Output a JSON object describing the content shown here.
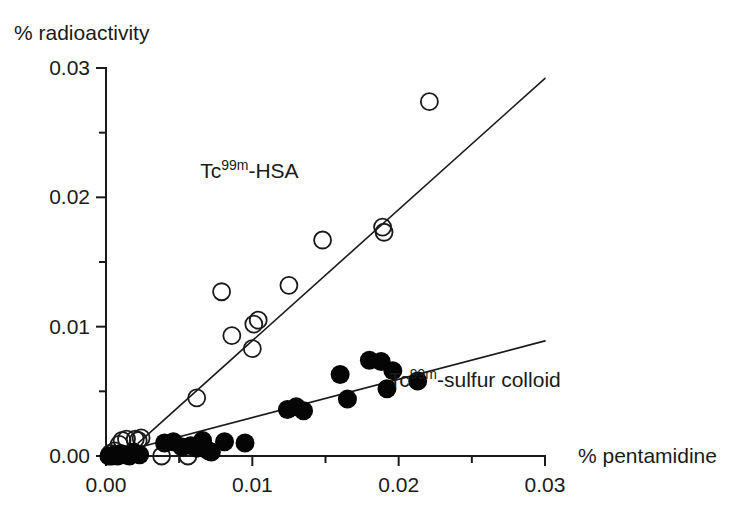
{
  "figure": {
    "background": "#ffffff",
    "ink_color": "#1a1a1a"
  },
  "chart_data": {
    "type": "scatter",
    "title": "",
    "xlabel": "% pentamidine",
    "ylabel": "% radioactivity",
    "xlim": [
      0.0,
      0.03
    ],
    "ylim": [
      0.0,
      0.03
    ],
    "grid": false,
    "legend_position": "inline-annotation",
    "x_ticks": [
      0.0,
      0.005,
      0.01,
      0.015,
      0.02,
      0.025,
      0.03
    ],
    "x_ticklabels": [
      "0.00",
      "",
      "0.01",
      "",
      "0.02",
      "",
      "0.03"
    ],
    "x_major_ticklabels": [
      "0.00",
      "0.01",
      "0.02",
      "0.03"
    ],
    "y_ticks": [
      0.0,
      0.005,
      0.01,
      0.015,
      0.02,
      0.025,
      0.03
    ],
    "y_ticklabels": [
      "0.00",
      "",
      "0.01",
      "",
      "0.02",
      "",
      "0.03"
    ],
    "y_major_ticklabels": [
      "0.00",
      "0.01",
      "0.02",
      "0.03"
    ],
    "series": [
      {
        "name": "Tc99m-HSA",
        "label_prefix": "Tc",
        "label_superscript": "99m",
        "label_suffix": "-HSA",
        "marker": "open-circle",
        "marker_color": "#1a1a1a",
        "annotation_x": 0.0098,
        "annotation_y": 0.0215,
        "points": [
          {
            "x": 0.0003,
            "y": 0.0002
          },
          {
            "x": 0.0006,
            "y": 0.0004
          },
          {
            "x": 0.0009,
            "y": 0.0009
          },
          {
            "x": 0.0011,
            "y": 0.0012
          },
          {
            "x": 0.0014,
            "y": 0.0013
          },
          {
            "x": 0.002,
            "y": 0.0013
          },
          {
            "x": 0.0022,
            "y": 0.0012
          },
          {
            "x": 0.0024,
            "y": 0.0014
          },
          {
            "x": 0.0038,
            "y": 0.0
          },
          {
            "x": 0.0056,
            "y": 0.0
          },
          {
            "x": 0.0062,
            "y": 0.0045
          },
          {
            "x": 0.0079,
            "y": 0.0127
          },
          {
            "x": 0.0086,
            "y": 0.0093
          },
          {
            "x": 0.01,
            "y": 0.0083
          },
          {
            "x": 0.0101,
            "y": 0.0102
          },
          {
            "x": 0.0104,
            "y": 0.0105
          },
          {
            "x": 0.0125,
            "y": 0.0132
          },
          {
            "x": 0.0148,
            "y": 0.0167
          },
          {
            "x": 0.0189,
            "y": 0.0177
          },
          {
            "x": 0.019,
            "y": 0.0173
          },
          {
            "x": 0.0221,
            "y": 0.0274
          }
        ],
        "fit_line": {
          "x1": 0.0022,
          "y1": 0.001,
          "x2": 0.03,
          "y2": 0.0292
        }
      },
      {
        "name": "Tc99m-sulfur colloid",
        "label_prefix": "Tc",
        "label_superscript": "99m",
        "label_suffix": "-sulfur colloid",
        "marker": "filled-circle",
        "marker_color": "#050505",
        "annotation_x": 0.0252,
        "annotation_y": 0.0053,
        "points": [
          {
            "x": 0.0002,
            "y": 0.0
          },
          {
            "x": 0.0004,
            "y": 0.0
          },
          {
            "x": 0.0006,
            "y": 0.0001
          },
          {
            "x": 0.0008,
            "y": 0.0
          },
          {
            "x": 0.001,
            "y": 0.0002
          },
          {
            "x": 0.0013,
            "y": 0.0001
          },
          {
            "x": 0.0016,
            "y": 0.0
          },
          {
            "x": 0.0019,
            "y": 0.0003
          },
          {
            "x": 0.0023,
            "y": 0.0001
          },
          {
            "x": 0.004,
            "y": 0.001
          },
          {
            "x": 0.0046,
            "y": 0.0011
          },
          {
            "x": 0.0052,
            "y": 0.0007
          },
          {
            "x": 0.0058,
            "y": 0.0008
          },
          {
            "x": 0.0062,
            "y": 0.0006
          },
          {
            "x": 0.0066,
            "y": 0.0012
          },
          {
            "x": 0.007,
            "y": 0.0004
          },
          {
            "x": 0.0072,
            "y": 0.0003
          },
          {
            "x": 0.0081,
            "y": 0.0011
          },
          {
            "x": 0.0095,
            "y": 0.001
          },
          {
            "x": 0.0124,
            "y": 0.0036
          },
          {
            "x": 0.013,
            "y": 0.0038
          },
          {
            "x": 0.0135,
            "y": 0.0035
          },
          {
            "x": 0.016,
            "y": 0.0063
          },
          {
            "x": 0.0165,
            "y": 0.0044
          },
          {
            "x": 0.018,
            "y": 0.0074
          },
          {
            "x": 0.0188,
            "y": 0.0073
          },
          {
            "x": 0.0192,
            "y": 0.0052
          },
          {
            "x": 0.0196,
            "y": 0.0066
          },
          {
            "x": 0.0213,
            "y": 0.0058
          }
        ],
        "fit_line": {
          "x1": 0.0,
          "y1": 0.0,
          "x2": 0.03,
          "y2": 0.0089
        }
      }
    ]
  }
}
